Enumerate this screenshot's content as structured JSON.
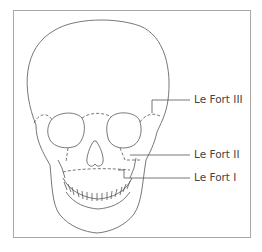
{
  "diagram": {
    "labels": [
      {
        "id": "le-fort-iii",
        "text": "Le Fort III"
      },
      {
        "id": "le-fort-ii",
        "text": "Le Fort II"
      },
      {
        "id": "le-fort-i",
        "text": "Le Fort I"
      }
    ],
    "colors": {
      "line": "#555555",
      "frame": "#a8a8a8",
      "text": "#444444"
    }
  }
}
